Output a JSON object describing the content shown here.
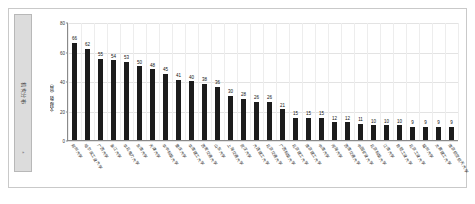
{
  "side_tab": {
    "label": "机构分布",
    "sub": "»"
  },
  "chart_data": {
    "type": "bar",
    "title": "",
    "subtitle": "",
    "xlabel": "",
    "ylabel": "文献数（篇）",
    "ylim": [
      0,
      80
    ],
    "yticks": [
      0,
      20,
      40,
      60,
      80
    ],
    "grid": true,
    "legend": "none",
    "bar_color": "#1c1c1c",
    "categories": [
      "郑州大学",
      "哈尔滨工业大学",
      "广西大学",
      "浙江大学",
      "华北电力大学",
      "东南大学",
      "天津大学",
      "华中科技大学",
      "重庆大学",
      "华南理工大学",
      "西安交通大学",
      "山东大学",
      "上海交通大学",
      "武汉大学",
      "大连理工大学",
      "北京交通大学",
      "广西科技大学",
      "北京理工大学",
      "南京理工大学",
      "中南大学",
      "河海大学",
      "西南交通大学",
      "中国矿业大学",
      "北京科技大学",
      "江南大学",
      "合肥工业大学",
      "北京工业大学",
      "福州大学",
      "太原理工大学",
      "南京航空航天大学"
    ],
    "values": [
      66,
      62,
      55,
      54,
      53,
      50,
      48,
      45,
      41,
      40,
      38,
      36,
      30,
      28,
      26,
      26,
      21,
      15,
      15,
      15,
      12,
      12,
      11,
      10,
      10,
      10,
      9,
      9,
      9,
      9
    ]
  }
}
